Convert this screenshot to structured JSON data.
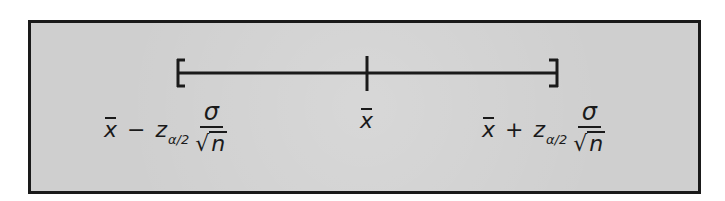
{
  "diagram": {
    "colors": {
      "frame_border": "#1a1a1a",
      "frame_fill": "#cfcfcf",
      "line": "#1a1a1a"
    },
    "interval": {
      "left_bracket": "[",
      "right_bracket": "]",
      "center_tick": "|"
    },
    "labels": {
      "lower": {
        "mean": "x",
        "operator": "−",
        "z": "z",
        "z_subscript": "α/2",
        "numerator": "σ",
        "sqrt": "√",
        "denominator": "n"
      },
      "center": {
        "mean": "x"
      },
      "upper": {
        "mean": "x",
        "operator": "+",
        "z": "z",
        "z_subscript": "α/2",
        "numerator": "σ",
        "sqrt": "√",
        "denominator": "n"
      }
    }
  }
}
